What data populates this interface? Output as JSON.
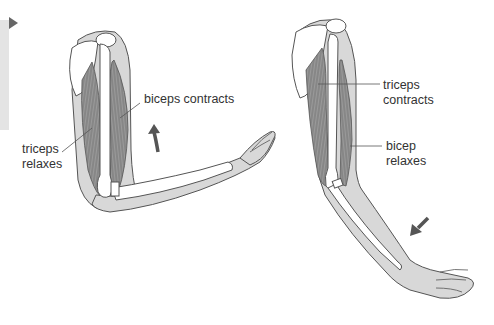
{
  "diagram": {
    "type": "anatomy",
    "panels": [
      {
        "name": "arm-flexed",
        "labels": [
          {
            "id": "biceps-contracts",
            "text": "biceps contracts"
          },
          {
            "id": "triceps-relaxes",
            "line1": "triceps",
            "line2": "relaxes"
          }
        ],
        "arrow": "up"
      },
      {
        "name": "arm-extended",
        "labels": [
          {
            "id": "triceps-contracts",
            "line1": "triceps",
            "line2": "contracts"
          },
          {
            "id": "bicep-relaxes",
            "line1": "bicep",
            "line2": "relaxes"
          }
        ],
        "arrow": "down-left"
      }
    ],
    "colors": {
      "skin": "#dcdcdc",
      "muscle": "#8c8c8c",
      "bone": "#ffffff",
      "outline": "#555555",
      "arrow": "#555555",
      "text": "#333333"
    }
  }
}
